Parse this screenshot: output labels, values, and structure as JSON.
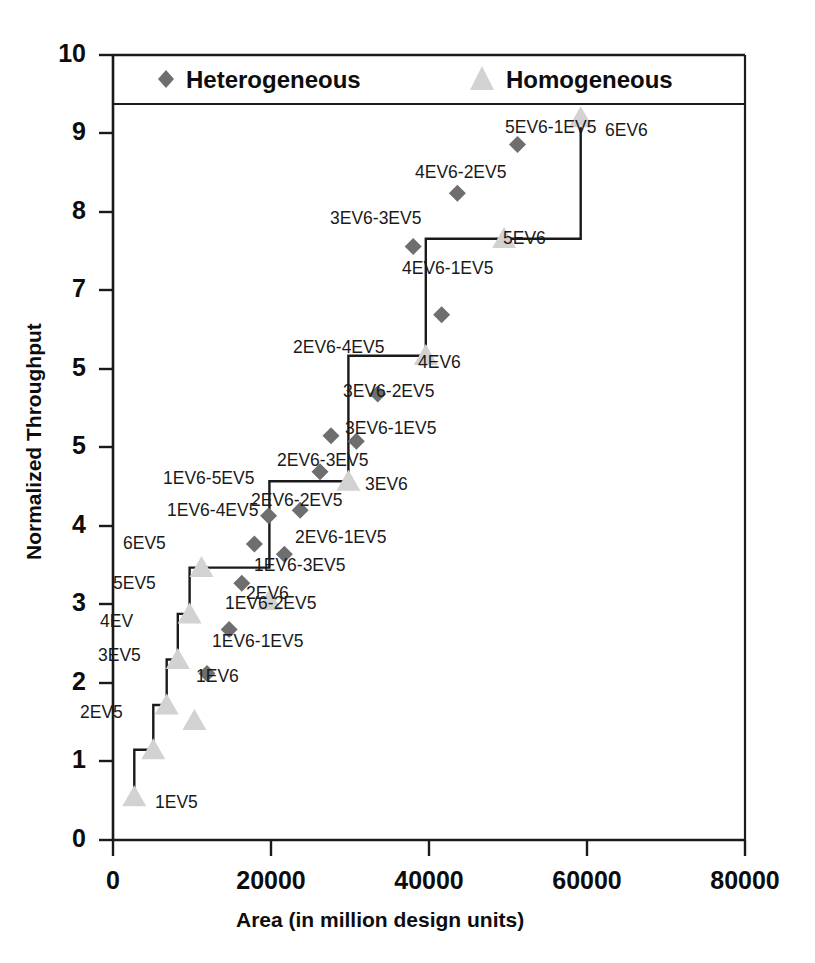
{
  "chart_data": {
    "type": "scatter",
    "title": "",
    "xlabel": "Area (in million design units)",
    "ylabel": "Normalized Throughput",
    "xlim": [
      0,
      80000
    ],
    "ylim": [
      0,
      10
    ],
    "grid": false,
    "legend_position": "top-inside-box",
    "xticks": [
      "0",
      "20000",
      "40000",
      "60000",
      "80000"
    ],
    "xtick_values": [
      0,
      20000,
      40000,
      60000,
      80000
    ],
    "yticks": [
      "0",
      "1",
      "2",
      "3",
      "4",
      "5",
      "5",
      "7",
      "8",
      "9",
      "10"
    ],
    "ytick_values": [
      0,
      1,
      2,
      3,
      4,
      5,
      6,
      7,
      8,
      9,
      10
    ],
    "legend": [
      {
        "name": "Heterogeneous",
        "marker": "diamond",
        "color": "#6e6e6e"
      },
      {
        "name": "Homogeneous",
        "marker": "triangle",
        "color": "#d2d2d2"
      }
    ],
    "series": [
      {
        "name": "Homogeneous",
        "marker": "triangle",
        "color": "#d2d2d2",
        "connected_by_step_line": true,
        "points": [
          {
            "label": "1EV5",
            "x": 2700,
            "y": 0.55,
            "lx": 155,
            "ly": 792
          },
          {
            "label": "2EV5",
            "x": 5100,
            "y": 1.15,
            "lx": 80,
            "ly": 702
          },
          {
            "label": "3EV5",
            "x": 6800,
            "y": 1.72,
            "lx": 98,
            "ly": 645
          },
          {
            "label": "4EV",
            "x": 8200,
            "y": 2.3,
            "lx": 100,
            "ly": 611
          },
          {
            "label": "5EV5",
            "x": 9700,
            "y": 2.88,
            "lx": 113,
            "ly": 573
          },
          {
            "label": "6EV5",
            "x": 11200,
            "y": 3.47,
            "lx": 123,
            "ly": 533
          },
          {
            "label": "1EV6",
            "x": 10300,
            "y": 1.52,
            "lx": 196,
            "ly": 666
          },
          {
            "label": "2EV6",
            "x": 19800,
            "y": 3.05,
            "lx": 246,
            "ly": 583
          },
          {
            "label": "3EV6",
            "x": 29800,
            "y": 4.57,
            "lx": 365,
            "ly": 474
          },
          {
            "label": "4EV6",
            "x": 39600,
            "y": 6.17,
            "lx": 418,
            "ly": 352
          },
          {
            "label": "5EV6",
            "x": 49500,
            "y": 7.66,
            "lx": 503,
            "ly": 228
          },
          {
            "label": "6EV6",
            "x": 59200,
            "y": 9.2,
            "lx": 605,
            "ly": 120
          }
        ]
      },
      {
        "name": "Heterogeneous",
        "marker": "diamond",
        "color": "#6e6e6e",
        "connected_by_step_line": false,
        "points": [
          {
            "label": "1EV6-1EV5",
            "x": 11900,
            "y": 2.12,
            "lx": 212,
            "ly": 631
          },
          {
            "label": "1EV6-2EV5",
            "x": 14700,
            "y": 2.68,
            "lx": 225,
            "ly": 593
          },
          {
            "label": "1EV6-3EV5",
            "x": 16300,
            "y": 3.27,
            "lx": 254,
            "ly": 555
          },
          {
            "label": "1EV6-4EV5",
            "x": 17900,
            "y": 3.77,
            "lx": 167,
            "ly": 500
          },
          {
            "label": "1EV6-5EV5",
            "x": 19700,
            "y": 4.13,
            "lx": 163,
            "ly": 468
          },
          {
            "label": "2EV6-1EV5",
            "x": 21700,
            "y": 3.64,
            "lx": 295,
            "ly": 527
          },
          {
            "label": "2EV6-2EV5",
            "x": 23700,
            "y": 4.2,
            "lx": 251,
            "ly": 490
          },
          {
            "label": "2EV6-3EV5",
            "x": 26200,
            "y": 4.69,
            "lx": 277,
            "ly": 450
          },
          {
            "label": "2EV6-4EV5",
            "x": 27600,
            "y": 5.15,
            "lx": 293,
            "ly": 337
          },
          {
            "label": "3EV6-1EV5",
            "x": 30800,
            "y": 5.08,
            "lx": 345,
            "ly": 418
          },
          {
            "label": "3EV6-2EV5",
            "x": 33500,
            "y": 5.68,
            "lx": 343,
            "ly": 381
          },
          {
            "label": "3EV6-3EV5",
            "x": 38000,
            "y": 7.56,
            "lx": 330,
            "ly": 208
          },
          {
            "label": "4EV6-1EV5",
            "x": 41600,
            "y": 6.69,
            "lx": 402,
            "ly": 258
          },
          {
            "label": "4EV6-2EV5",
            "x": 43600,
            "y": 8.24,
            "lx": 415,
            "ly": 162
          },
          {
            "label": "5EV6-1EV5",
            "x": 51200,
            "y": 8.86,
            "lx": 505,
            "ly": 117
          }
        ]
      }
    ],
    "step_line_vertices": [
      [
        2700,
        0.55
      ],
      [
        2700,
        1.15
      ],
      [
        5100,
        1.15
      ],
      [
        5100,
        1.72
      ],
      [
        6800,
        1.72
      ],
      [
        6800,
        2.3
      ],
      [
        8200,
        2.3
      ],
      [
        8200,
        2.88
      ],
      [
        9700,
        2.88
      ],
      [
        9700,
        3.47
      ],
      [
        11200,
        3.47
      ],
      [
        19800,
        3.47
      ],
      [
        19800,
        4.57
      ],
      [
        29800,
        4.57
      ],
      [
        29800,
        6.17
      ],
      [
        39600,
        6.17
      ],
      [
        39600,
        7.66
      ],
      [
        49500,
        7.66
      ],
      [
        59200,
        7.66
      ],
      [
        59200,
        9.2
      ]
    ]
  },
  "axes": {
    "x_title": "Area (in million design units)",
    "y_title": "Normalized Throughput"
  },
  "legend": {
    "heterogeneous_label": "Heterogeneous",
    "homogeneous_label": "Homogeneous"
  },
  "colors": {
    "heterogeneous_marker": "#6e6e6e",
    "homogeneous_marker": "#d2d2d2",
    "axis": "#1a1a1a",
    "text": "#0d0d0d",
    "background": "#ffffff"
  }
}
